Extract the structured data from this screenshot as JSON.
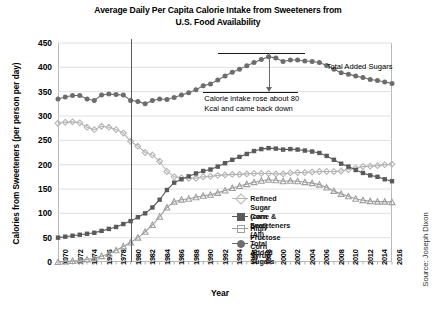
{
  "chart_data": {
    "type": "line",
    "title": "Average Daily Per Capita Calorie Intake from Sweeteners from U.S. Food Availability",
    "title_line1": "Average Daily Per Capita Calorie Intake from Sweeteners from",
    "title_line2": "U.S. Food Availability",
    "xlabel": "Year",
    "ylabel": "Calories from Sweeteners (per person per day)",
    "source": "Source: Joseph Dixon",
    "grid": true,
    "legend_position": "inside-center-right",
    "ylim": [
      0,
      450
    ],
    "yticks": [
      0,
      50,
      100,
      150,
      200,
      250,
      300,
      350,
      400,
      450
    ],
    "xlim": [
      1970,
      2016
    ],
    "xticks": [
      1970,
      1972,
      1974,
      1976,
      1978,
      1980,
      1982,
      1984,
      1986,
      1988,
      1990,
      1992,
      1994,
      1996,
      1998,
      2000,
      2002,
      2004,
      2006,
      2008,
      2010,
      2012,
      2014,
      2016
    ],
    "x": [
      1970,
      1971,
      1972,
      1973,
      1974,
      1975,
      1976,
      1977,
      1978,
      1979,
      1980,
      1981,
      1982,
      1983,
      1984,
      1985,
      1986,
      1987,
      1988,
      1989,
      1990,
      1991,
      1992,
      1993,
      1994,
      1995,
      1996,
      1997,
      1998,
      1999,
      2000,
      2001,
      2002,
      2003,
      2004,
      2005,
      2006,
      2007,
      2008,
      2009,
      2010,
      2011,
      2012,
      2013,
      2014,
      2015,
      2016
    ],
    "series": [
      {
        "name": "Refined Sugar (cane & beet)",
        "marker": "diamond",
        "color": "#b5b5b5",
        "values": [
          285,
          287,
          288,
          286,
          277,
          272,
          279,
          277,
          272,
          265,
          248,
          238,
          225,
          220,
          207,
          186,
          175,
          173,
          172,
          172,
          175,
          176,
          178,
          179,
          180,
          180,
          181,
          182,
          182,
          182,
          181,
          181,
          183,
          184,
          184,
          185,
          186,
          186,
          186,
          187,
          190,
          193,
          196,
          197,
          198,
          200,
          201
        ]
      },
      {
        "name": "Corn Sweeteners (All)",
        "marker": "square",
        "color": "#5a5a5a",
        "values": [
          50,
          52,
          54,
          56,
          58,
          60,
          64,
          68,
          72,
          78,
          84,
          92,
          100,
          112,
          128,
          148,
          163,
          170,
          176,
          182,
          187,
          190,
          196,
          203,
          210,
          216,
          222,
          228,
          232,
          234,
          233,
          231,
          232,
          231,
          229,
          227,
          224,
          218,
          210,
          202,
          196,
          189,
          183,
          178,
          175,
          170,
          166
        ]
      },
      {
        "name": "High Fructose Corn Syrup",
        "marker": "triangle",
        "color": "#9e9e9e",
        "values": [
          0,
          1,
          2,
          3,
          5,
          8,
          12,
          17,
          24,
          32,
          40,
          50,
          62,
          76,
          93,
          112,
          124,
          128,
          130,
          133,
          136,
          138,
          142,
          147,
          152,
          156,
          160,
          164,
          167,
          169,
          168,
          166,
          167,
          166,
          164,
          162,
          159,
          153,
          146,
          140,
          135,
          130,
          127,
          125,
          124,
          124,
          123
        ]
      },
      {
        "name": "Total Added Sugars",
        "marker": "circle",
        "color": "#6d6d6d",
        "values": [
          335,
          339,
          342,
          342,
          335,
          332,
          343,
          345,
          344,
          343,
          332,
          330,
          325,
          332,
          335,
          334,
          338,
          343,
          348,
          354,
          362,
          366,
          374,
          382,
          390,
          396,
          403,
          410,
          416,
          422,
          419,
          412,
          415,
          415,
          413,
          412,
          410,
          404,
          396,
          389,
          386,
          382,
          379,
          375,
          373,
          370,
          367
        ]
      }
    ],
    "annotations": [
      {
        "name": "total-added-sugars-callout",
        "text": "Total Added Sugars"
      },
      {
        "name": "calorie-rise-note",
        "line1": "Calorie intake rose about 80",
        "line2": "Kcal and came back down"
      }
    ],
    "reference_marks": {
      "upper_bar_value": 430,
      "lower_bar_value": 350,
      "vertical_divider_year": 1980
    }
  }
}
